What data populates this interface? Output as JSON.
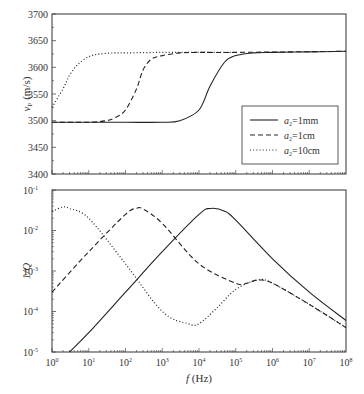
{
  "chart_data": [
    {
      "type": "line",
      "panel": "top",
      "xlabel": "f (Hz)",
      "ylabel": "v_P (m/s)",
      "xscale": "log",
      "xlim": [
        1,
        100000000
      ],
      "ylim": [
        3400,
        3700
      ],
      "yticks": [
        3400,
        3450,
        3500,
        3550,
        3600,
        3650,
        3700
      ],
      "ytick_labels": [
        "3400",
        "3450",
        "3500",
        "3550",
        "3600",
        "3650",
        "3700"
      ],
      "legend_position": "lower right",
      "series": [
        {
          "name": "a2=1mm",
          "style": "solid",
          "x": [
            1,
            10,
            100,
            1000,
            3000,
            10000,
            20000,
            50000,
            100000,
            300000,
            1000000,
            10000000,
            100000000
          ],
          "y": [
            3497,
            3497,
            3497,
            3497,
            3500,
            3520,
            3565,
            3610,
            3622,
            3627,
            3628,
            3629,
            3630
          ]
        },
        {
          "name": "a2=1cm",
          "style": "dashed",
          "x": [
            1,
            10,
            30,
            50,
            100,
            200,
            300,
            500,
            1000,
            3000,
            10000,
            100000,
            100000000
          ],
          "y": [
            3497,
            3497,
            3500,
            3505,
            3520,
            3560,
            3595,
            3615,
            3622,
            3627,
            3628,
            3628,
            3630
          ]
        },
        {
          "name": "a2=10cm",
          "style": "dotted",
          "x": [
            1,
            2,
            3,
            5,
            10,
            20,
            50,
            100,
            1000,
            10000,
            100000
          ],
          "y": [
            3525,
            3560,
            3585,
            3605,
            3620,
            3625,
            3627,
            3627,
            3628,
            3628,
            3628
          ]
        }
      ]
    },
    {
      "type": "line",
      "panel": "bottom",
      "xlabel": "f (Hz)",
      "ylabel": "1/Q",
      "xscale": "log",
      "yscale": "log",
      "xlim": [
        1,
        100000000
      ],
      "ylim": [
        1e-05,
        0.1
      ],
      "xticks": [
        1,
        10,
        100,
        1000,
        10000,
        100000,
        1000000,
        10000000,
        100000000
      ],
      "xtick_labels": [
        "10^0",
        "10^1",
        "10^2",
        "10^3",
        "10^4",
        "10^5",
        "10^6",
        "10^7",
        "10^8"
      ],
      "ytick_labels": [
        "10^-5",
        "10^-4",
        "10^-3",
        "10^-2",
        "10^-1"
      ],
      "series": [
        {
          "name": "a2=1mm",
          "style": "solid",
          "x": [
            3,
            10,
            100,
            1000,
            10000,
            20000,
            50000,
            100000,
            1000000,
            10000000,
            100000000
          ],
          "y": [
            1e-05,
            3e-05,
            0.0003,
            0.003,
            0.025,
            0.035,
            0.03,
            0.018,
            0.002,
            0.0003,
            6e-05
          ]
        },
        {
          "name": "a2=1cm",
          "style": "dashed",
          "x": [
            1,
            10,
            100,
            200,
            300,
            1000,
            10000,
            100000,
            200000,
            400000,
            1000000,
            10000000,
            100000000
          ],
          "y": [
            0.0003,
            0.003,
            0.025,
            0.035,
            0.034,
            0.015,
            0.0015,
            0.0005,
            0.0005,
            0.0006,
            0.0005,
            0.00015,
            4e-05
          ]
        },
        {
          "name": "a2=10cm",
          "style": "dotted",
          "x": [
            1,
            2,
            3,
            10,
            100,
            1000,
            5000,
            10000,
            30000,
            100000,
            400000,
            1000000,
            10000000,
            100000000
          ],
          "y": [
            0.03,
            0.038,
            0.035,
            0.02,
            0.0015,
            0.0001,
            5e-05,
            5e-05,
            0.00012,
            0.00035,
            0.0006,
            0.0005,
            0.00015,
            4e-05
          ]
        }
      ]
    }
  ],
  "labels": {
    "top_ylabel_main": "v",
    "top_ylabel_sub": "P",
    "top_ylabel_unit": " (m/s)",
    "bottom_ylabel": "1/Q",
    "xlabel_main": "f",
    "xlabel_unit": " (Hz)"
  },
  "legend": [
    {
      "label_main": "a",
      "label_sub": "2",
      "label_rest": "=1mm",
      "style": "solid"
    },
    {
      "label_main": "a",
      "label_sub": "2",
      "label_rest": "=1cm",
      "style": "dashed"
    },
    {
      "label_main": "a",
      "label_sub": "2",
      "label_rest": "=10cm",
      "style": "dotted"
    }
  ],
  "top_yticks": [
    "3400",
    "3450",
    "3500",
    "3550",
    "3600",
    "3650",
    "3700"
  ],
  "bottom_yticks": [
    {
      "base": "10",
      "exp": "-5"
    },
    {
      "base": "10",
      "exp": "-4"
    },
    {
      "base": "10",
      "exp": "-3"
    },
    {
      "base": "10",
      "exp": "-2"
    },
    {
      "base": "10",
      "exp": "-1"
    }
  ],
  "xticks": [
    {
      "base": "10",
      "exp": "0"
    },
    {
      "base": "10",
      "exp": "1"
    },
    {
      "base": "10",
      "exp": "2"
    },
    {
      "base": "10",
      "exp": "3"
    },
    {
      "base": "10",
      "exp": "4"
    },
    {
      "base": "10",
      "exp": "5"
    },
    {
      "base": "10",
      "exp": "6"
    },
    {
      "base": "10",
      "exp": "7"
    },
    {
      "base": "10",
      "exp": "8"
    }
  ]
}
